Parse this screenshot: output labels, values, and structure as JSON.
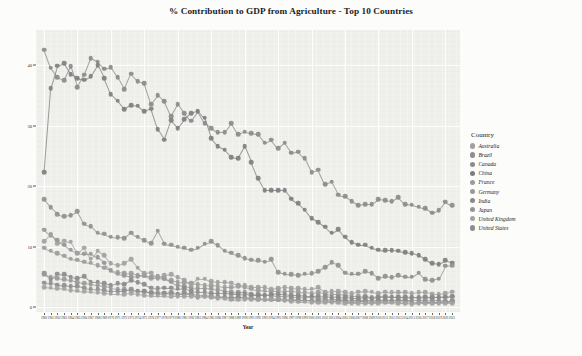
{
  "chart_data": {
    "type": "line",
    "title": "% Contribution to GDP from Agriculture - Top 10 Countries",
    "xlabel": "Year",
    "ylabel": "Agriculture % Contribution to GDP",
    "ylim": [
      0,
      45
    ],
    "yticks": [
      0,
      10,
      20,
      30,
      40
    ],
    "ytick_labels": [
      "0",
      "10",
      "20",
      "30",
      "40"
    ],
    "grid": true,
    "legend_title": "Country",
    "legend_position": "right",
    "markers": "filled-circle",
    "x": [
      1960,
      1961,
      1962,
      1963,
      1964,
      1965,
      1966,
      1967,
      1968,
      1969,
      1970,
      1971,
      1972,
      1973,
      1974,
      1975,
      1976,
      1977,
      1978,
      1979,
      1980,
      1981,
      1982,
      1983,
      1984,
      1985,
      1986,
      1987,
      1988,
      1989,
      1990,
      1991,
      1992,
      1993,
      1994,
      1995,
      1996,
      1997,
      1998,
      1999,
      2000,
      2001,
      2002,
      2003,
      2004,
      2005,
      2006,
      2007,
      2008,
      2009,
      2010,
      2011,
      2012,
      2013,
      2014,
      2015,
      2016,
      2017,
      2018,
      2019,
      2020,
      2021
    ],
    "series": [
      {
        "name": "India",
        "color": "#8a8a8a",
        "values": [
          42.6,
          39.6,
          38.0,
          37.5,
          39.8,
          36.4,
          38.4,
          41.2,
          40.6,
          39.4,
          39.7,
          38.0,
          36.0,
          38.6,
          37.4,
          37.0,
          33.6,
          35.0,
          34.0,
          31.6,
          33.6,
          32.1,
          30.8,
          32.3,
          30.4,
          29.6,
          28.9,
          28.9,
          30.4,
          28.6,
          29.0,
          28.8,
          28.6,
          27.2,
          27.7,
          26.3,
          27.2,
          25.5,
          25.7,
          24.6,
          22.3,
          22.7,
          20.3,
          20.7,
          18.6,
          18.3,
          17.5,
          16.8,
          17.0,
          17.0,
          17.8,
          17.7,
          17.5,
          18.2,
          17.0,
          16.9,
          16.6,
          16.3,
          15.6,
          16.0,
          17.4,
          16.8
        ]
      },
      {
        "name": "China",
        "color": "#7d7d7d",
        "values": [
          22.3,
          36.2,
          39.9,
          40.3,
          38.5,
          37.9,
          37.6,
          38.2,
          40.0,
          37.9,
          35.2,
          34.1,
          32.7,
          33.4,
          33.3,
          32.4,
          32.8,
          29.4,
          27.7,
          30.9,
          29.6,
          31.1,
          32.1,
          32.5,
          31.3,
          27.9,
          26.6,
          26.0,
          24.8,
          24.6,
          26.6,
          24.0,
          21.3,
          19.3,
          19.3,
          19.3,
          19.3,
          17.9,
          17.2,
          16.1,
          14.7,
          14.0,
          13.3,
          12.3,
          12.9,
          11.6,
          10.7,
          10.3,
          10.3,
          9.8,
          9.5,
          9.4,
          9.4,
          9.3,
          9.1,
          8.9,
          8.6,
          7.9,
          7.2,
          7.1,
          7.7,
          7.3
        ]
      },
      {
        "name": "Brazil",
        "color": "#8f8f8f",
        "values": [
          17.8,
          16.5,
          15.4,
          15.0,
          15.2,
          15.8,
          13.8,
          13.4,
          12.3,
          12.1,
          11.6,
          11.5,
          11.4,
          12.3,
          11.6,
          11.1,
          10.6,
          12.6,
          10.5,
          10.3,
          10.0,
          9.8,
          9.5,
          9.8,
          10.5,
          10.9,
          10.2,
          9.3,
          9.0,
          8.6,
          8.1,
          7.8,
          7.7,
          7.5,
          7.9,
          5.8,
          5.5,
          5.4,
          5.3,
          5.5,
          5.6,
          5.9,
          6.6,
          7.4,
          6.9,
          5.7,
          5.5,
          5.5,
          5.9,
          5.6,
          4.8,
          5.1,
          4.9,
          5.3,
          5.0,
          5.0,
          5.7,
          4.6,
          4.4,
          4.7,
          6.8,
          6.9
        ]
      },
      {
        "name": "Japan",
        "color": "#959595",
        "values": [
          12.8,
          11.9,
          11.1,
          10.3,
          9.5,
          9.0,
          8.8,
          8.8,
          8.2,
          7.3,
          6.0,
          5.5,
          5.3,
          5.0,
          5.1,
          5.3,
          5.0,
          5.1,
          4.8,
          4.2,
          3.6,
          3.4,
          3.2,
          3.1,
          3.1,
          3.0,
          2.9,
          2.6,
          2.5,
          2.4,
          2.4,
          2.2,
          2.1,
          2.0,
          2.0,
          1.8,
          1.8,
          1.7,
          1.7,
          1.6,
          1.6,
          1.5,
          1.4,
          1.3,
          1.3,
          1.2,
          1.2,
          1.2,
          1.2,
          1.2,
          1.2,
          1.2,
          1.2,
          1.2,
          1.2,
          1.2,
          1.2,
          1.2,
          1.1,
          1.1,
          1.0,
          1.0
        ]
      },
      {
        "name": "France",
        "color": "#9b9b9b",
        "values": [
          9.8,
          9.3,
          8.9,
          8.5,
          8.0,
          7.8,
          7.5,
          7.3,
          6.9,
          6.5,
          6.2,
          5.8,
          5.7,
          5.6,
          5.3,
          5.2,
          4.8,
          4.8,
          4.7,
          4.5,
          4.2,
          4.1,
          4.0,
          3.8,
          3.7,
          3.6,
          3.5,
          3.3,
          3.3,
          3.4,
          3.3,
          3.0,
          2.8,
          2.7,
          2.7,
          2.7,
          2.6,
          2.6,
          2.5,
          2.4,
          2.3,
          2.4,
          2.2,
          2.1,
          2.1,
          2.0,
          1.9,
          1.9,
          1.8,
          1.6,
          1.7,
          1.8,
          1.7,
          1.7,
          1.6,
          1.6,
          1.5,
          1.6,
          1.6,
          1.6,
          1.6,
          1.7
        ]
      },
      {
        "name": "Australia",
        "color": "#a0a0a0",
        "values": [
          10.9,
          12.0,
          10.5,
          11.0,
          10.8,
          8.8,
          9.8,
          8.0,
          9.3,
          8.6,
          7.2,
          6.9,
          7.2,
          7.9,
          6.5,
          5.6,
          5.7,
          5.0,
          5.3,
          5.4,
          4.9,
          4.5,
          3.8,
          4.7,
          4.7,
          4.3,
          4.1,
          4.1,
          4.0,
          3.7,
          3.6,
          3.3,
          3.3,
          3.3,
          2.9,
          3.1,
          3.3,
          3.2,
          3.1,
          3.0,
          3.0,
          3.3,
          2.5,
          2.6,
          2.6,
          2.5,
          2.3,
          2.5,
          2.6,
          2.5,
          2.3,
          2.5,
          2.4,
          2.4,
          2.4,
          2.3,
          2.4,
          2.4,
          2.2,
          2.2,
          2.3,
          2.5
        ]
      },
      {
        "name": "Canada",
        "color": "#8b8b8b",
        "values": [
          5.6,
          4.6,
          5.5,
          5.4,
          5.0,
          4.8,
          5.1,
          4.2,
          4.2,
          3.9,
          3.6,
          3.9,
          3.8,
          4.4,
          4.1,
          3.8,
          3.2,
          3.1,
          3.2,
          3.2,
          3.0,
          3.1,
          2.7,
          2.5,
          2.5,
          2.3,
          2.3,
          2.3,
          2.2,
          2.2,
          2.1,
          2.0,
          2.0,
          2.0,
          2.1,
          2.2,
          2.2,
          2.0,
          2.0,
          1.9,
          1.9,
          1.9,
          1.8,
          1.6,
          1.7,
          1.6,
          1.5,
          1.5,
          1.6,
          1.5,
          1.6,
          1.7,
          1.7,
          1.7,
          1.7,
          1.6,
          1.6,
          1.7,
          1.6,
          1.6,
          1.7,
          1.8
        ]
      },
      {
        "name": "Germany",
        "color": "#999999",
        "values": [
          5.4,
          5.0,
          4.8,
          4.6,
          4.4,
          4.1,
          3.9,
          3.8,
          3.6,
          3.4,
          3.2,
          3.0,
          2.9,
          2.7,
          2.6,
          2.6,
          2.4,
          2.4,
          2.3,
          2.2,
          2.1,
          2.1,
          2.1,
          2.0,
          2.0,
          1.9,
          1.8,
          1.7,
          1.6,
          1.6,
          1.5,
          1.4,
          1.3,
          1.2,
          1.2,
          1.2,
          1.1,
          1.1,
          1.1,
          1.1,
          1.1,
          1.2,
          1.1,
          1.0,
          1.0,
          0.9,
          0.9,
          1.0,
          0.9,
          0.8,
          0.9,
          0.9,
          0.9,
          0.9,
          0.8,
          0.7,
          0.8,
          0.8,
          0.8,
          0.8,
          0.9,
          1.0
        ]
      },
      {
        "name": "United States",
        "color": "#8e8e8e",
        "values": [
          4.0,
          3.9,
          3.7,
          3.6,
          3.4,
          3.4,
          3.2,
          3.0,
          2.9,
          2.8,
          2.6,
          2.6,
          2.6,
          3.0,
          2.7,
          2.6,
          2.3,
          2.2,
          2.3,
          2.4,
          2.2,
          2.4,
          2.1,
          1.6,
          1.8,
          1.7,
          1.6,
          1.6,
          1.4,
          1.6,
          1.6,
          1.5,
          1.5,
          1.3,
          1.4,
          1.3,
          1.4,
          1.3,
          1.2,
          1.1,
          1.0,
          1.0,
          0.9,
          1.0,
          1.1,
          1.0,
          0.9,
          1.0,
          1.0,
          0.9,
          1.0,
          1.1,
          1.0,
          1.2,
          1.1,
          0.9,
          0.8,
          0.9,
          0.8,
          0.8,
          0.9,
          1.0
        ]
      },
      {
        "name": "United Kingdom",
        "color": "#a3a3a3",
        "values": [
          3.3,
          3.2,
          3.1,
          3.0,
          2.8,
          2.7,
          2.6,
          2.5,
          2.4,
          2.3,
          2.2,
          2.2,
          2.1,
          2.3,
          2.1,
          2.0,
          1.9,
          1.9,
          1.9,
          1.8,
          1.8,
          1.8,
          1.8,
          1.7,
          1.8,
          1.6,
          1.5,
          1.4,
          1.2,
          1.2,
          1.3,
          1.3,
          1.3,
          1.3,
          1.3,
          1.4,
          1.2,
          1.0,
          0.9,
          0.9,
          0.8,
          0.7,
          0.8,
          0.8,
          0.7,
          0.6,
          0.6,
          0.6,
          0.6,
          0.6,
          0.6,
          0.7,
          0.7,
          0.6,
          0.6,
          0.5,
          0.6,
          0.6,
          0.6,
          0.6,
          0.6,
          0.6
        ]
      }
    ]
  },
  "legend": {
    "title": "Country",
    "items": [
      {
        "label": "Australia",
        "color": "#a0a0a0"
      },
      {
        "label": "Brazil",
        "color": "#8f8f8f"
      },
      {
        "label": "Canada",
        "color": "#8b8b8b"
      },
      {
        "label": "China",
        "color": "#7d7d7d"
      },
      {
        "label": "France",
        "color": "#9b9b9b"
      },
      {
        "label": "Germany",
        "color": "#999999"
      },
      {
        "label": "India",
        "color": "#8a8a8a"
      },
      {
        "label": "Japan",
        "color": "#959595"
      },
      {
        "label": "United Kingdom",
        "color": "#a3a3a3"
      },
      {
        "label": "United States",
        "color": "#8e8e8e"
      }
    ]
  },
  "caption": ""
}
